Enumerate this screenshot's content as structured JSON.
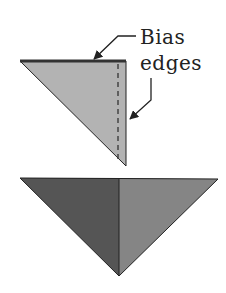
{
  "diagram": {
    "labels": {
      "line1": "Bias",
      "line2": "edges"
    },
    "colors": {
      "top_triangle_fill": "#b3b3b3",
      "bottom_left_fill": "#555555",
      "bottom_right_fill": "#858585",
      "outline": "#222222",
      "top_edge": "#333333"
    }
  }
}
